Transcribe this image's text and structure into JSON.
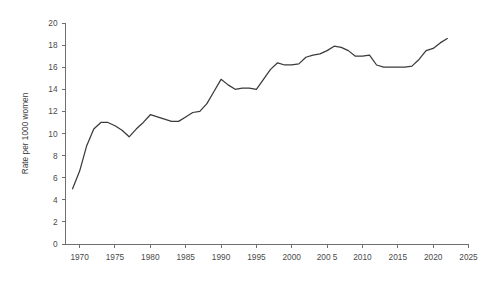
{
  "chart_data": {
    "type": "line",
    "title": "",
    "xlabel": "",
    "ylabel": "Rate per 1000 women",
    "xlim": [
      1968,
      2025
    ],
    "ylim": [
      0,
      20
    ],
    "grid": false,
    "legend": null,
    "legend_position": "none",
    "line_color": "#3a3a3a",
    "axis_color": "#6f6f6f",
    "label_color": "#4a4a4a",
    "background_color": "#ffffff",
    "y_ticks": [
      0,
      2,
      4,
      6,
      8,
      10,
      12,
      14,
      16,
      18,
      20
    ],
    "y_tick_labels": [
      "0",
      "2",
      "4",
      "6",
      "8",
      "10",
      "12",
      "14",
      "16",
      "18",
      "20"
    ],
    "x_ticks": [
      1970,
      1975,
      1980,
      1985,
      1990,
      1995,
      2000,
      2005,
      2010,
      2015,
      2020,
      2025
    ],
    "x_tick_labels": [
      "1970",
      "1975",
      "1980",
      "1985",
      "1990",
      "1995",
      "2000",
      "200 5",
      "2010",
      "2015",
      "2020",
      "2025"
    ],
    "x": [
      1969,
      1970,
      1971,
      1972,
      1973,
      1974,
      1975,
      1976,
      1977,
      1978,
      1979,
      1980,
      1981,
      1982,
      1983,
      1984,
      1985,
      1986,
      1987,
      1988,
      1989,
      1990,
      1991,
      1992,
      1993,
      1994,
      1995,
      1996,
      1997,
      1998,
      1999,
      2000,
      2001,
      2002,
      2003,
      2004,
      2005,
      2006,
      2007,
      2008,
      2009,
      2010,
      2011,
      2012,
      2013,
      2014,
      2015,
      2016,
      2017,
      2018,
      2019,
      2020,
      2021,
      2022
    ],
    "values": [
      5.0,
      6.6,
      8.9,
      10.4,
      11.0,
      11.0,
      10.7,
      10.3,
      9.7,
      10.4,
      11.0,
      11.7,
      11.5,
      11.3,
      11.1,
      11.1,
      11.5,
      11.9,
      12.0,
      12.7,
      13.8,
      14.9,
      14.4,
      14.0,
      14.1,
      14.1,
      14.0,
      14.9,
      15.8,
      16.4,
      16.2,
      16.2,
      16.3,
      16.9,
      17.1,
      17.2,
      17.5,
      17.9,
      17.8,
      17.5,
      17.0,
      17.0,
      17.1,
      16.2,
      16.0,
      16.0,
      16.0,
      16.0,
      16.1,
      16.7,
      17.5,
      17.7,
      18.2,
      18.6
    ],
    "series": [
      {
        "name": "Rate per 1000 women",
        "values": [
          5.0,
          6.6,
          8.9,
          10.4,
          11.0,
          11.0,
          10.7,
          10.3,
          9.7,
          10.4,
          11.0,
          11.7,
          11.5,
          11.3,
          11.1,
          11.1,
          11.5,
          11.9,
          12.0,
          12.7,
          13.8,
          14.9,
          14.4,
          14.0,
          14.1,
          14.1,
          14.0,
          14.9,
          15.8,
          16.4,
          16.2,
          16.2,
          16.3,
          16.9,
          17.1,
          17.2,
          17.5,
          17.9,
          17.8,
          17.5,
          17.0,
          17.0,
          17.1,
          16.2,
          16.0,
          16.0,
          16.0,
          16.0,
          16.1,
          16.7,
          17.5,
          17.7,
          18.2,
          18.6
        ]
      }
    ]
  }
}
